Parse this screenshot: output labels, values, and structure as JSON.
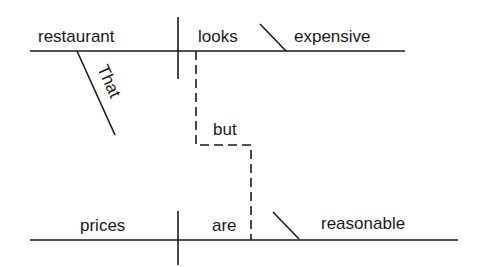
{
  "diagram": {
    "type": "sentence-diagram",
    "clause1": {
      "subject": "restaurant",
      "verb": "looks",
      "complement": "expensive",
      "modifier": "That"
    },
    "conjunction": "but",
    "clause2": {
      "subject": "prices",
      "verb": "are",
      "complement": "reasonable"
    }
  },
  "colors": {
    "ink": "#1a1a1a",
    "background": "#ffffff"
  }
}
